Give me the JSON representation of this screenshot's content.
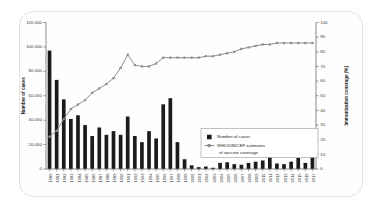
{
  "chart_data": {
    "type": "bar",
    "title": "",
    "xlabel": "",
    "ylabel": "Number of cases",
    "y2label": "Immunization coverage (%)",
    "ylim": [
      0,
      120000
    ],
    "y2lim": [
      0,
      100
    ],
    "yticks": [
      0,
      20000,
      40000,
      60000,
      80000,
      100000,
      120000
    ],
    "ytick_labels": [
      "0",
      "20,000",
      "40,000",
      "60,000",
      "80,000",
      "100,000",
      "120,000"
    ],
    "y2ticks": [
      0,
      10,
      20,
      30,
      40,
      50,
      60,
      70,
      80,
      90,
      100
    ],
    "y2tick_labels": [
      "0",
      "10",
      "20",
      "30",
      "40",
      "50",
      "60",
      "70",
      "80",
      "90",
      "100"
    ],
    "grid": false,
    "legend_position": "center-right",
    "categories": [
      "1980",
      "1981",
      "1982",
      "1983",
      "1984",
      "1985",
      "1986",
      "1987",
      "1988",
      "1989",
      "1990",
      "1991",
      "1992",
      "1993",
      "1994",
      "1995",
      "1996",
      "1997",
      "1998",
      "1999",
      "2000",
      "2001",
      "2002",
      "2003",
      "2004",
      "2005",
      "2006",
      "2007",
      "2008",
      "2009",
      "2010",
      "2011",
      "2012",
      "2013",
      "2014",
      "2015",
      "2016",
      "2017"
    ],
    "series": [
      {
        "name": "Number of cases",
        "axis": "left",
        "type": "bar",
        "color": "#1b1b1b",
        "values": [
          97000,
          73000,
          57000,
          41000,
          44000,
          36000,
          27000,
          34000,
          28000,
          31000,
          28000,
          43000,
          27000,
          22000,
          31000,
          25000,
          53000,
          58000,
          22000,
          8000,
          3000,
          1500,
          2000,
          1000,
          5000,
          5500,
          4000,
          3500,
          5000,
          6000,
          7000,
          10000,
          4500,
          4000,
          6000,
          9000,
          5000,
          11000
        ]
      },
      {
        "name": "WHO/UNICEF estimates of vaccine coverage",
        "axis": "right",
        "type": "line",
        "color": "#8c8c8c",
        "values": [
          22,
          26,
          34,
          41,
          44,
          47,
          52,
          55,
          58,
          62,
          69,
          78,
          71,
          70,
          70,
          72,
          76,
          76,
          76,
          76,
          76,
          76,
          77,
          77,
          78,
          79,
          80,
          82,
          83,
          84,
          85,
          85,
          86,
          86,
          86,
          86,
          86,
          86
        ]
      }
    ],
    "legend": [
      {
        "label": "Number of cases",
        "marker": "square",
        "color": "#1b1b1b"
      },
      {
        "label": "WHO/UNICEF estimates",
        "marker": "line-square",
        "color": "#8c8c8c"
      },
      {
        "label": "of vaccine coverage",
        "marker": "none",
        "color": "#8c8c8c"
      }
    ]
  }
}
